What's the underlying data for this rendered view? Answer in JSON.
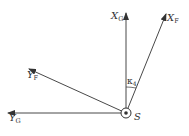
{
  "diagram": {
    "axes": [
      {
        "id": "XG",
        "label": "X",
        "subscript": "G"
      },
      {
        "id": "XF",
        "label": "X",
        "subscript": "F"
      },
      {
        "id": "YF",
        "label": "Y",
        "subscript": "F"
      },
      {
        "id": "YG",
        "label": "Y",
        "subscript": "G"
      }
    ],
    "angle": {
      "symbol": "κ",
      "subscript": "4"
    },
    "origin": {
      "label": "S"
    },
    "colors": {
      "stroke": "#333333",
      "background": "#ffffff"
    }
  }
}
